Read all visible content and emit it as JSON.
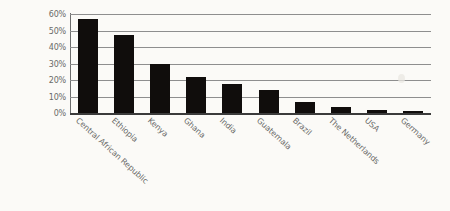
{
  "chart_data": {
    "type": "bar",
    "title": "",
    "xlabel": "",
    "ylabel": "",
    "categories": [
      "Central African Republic",
      "Ethiopia",
      "Kenya",
      "Ghana",
      "India",
      "Guatemala",
      "Brazil",
      "The Netherlands",
      "USA",
      "Germany"
    ],
    "values": [
      57,
      47.5,
      30,
      22,
      17.5,
      14,
      6.5,
      3.5,
      2,
      1.5
    ],
    "ylim": [
      0,
      60
    ],
    "ytick_labels": [
      "60%",
      "50%",
      "40%",
      "30%",
      "20%",
      "10%",
      "0%"
    ],
    "ytick_values": [
      60,
      50,
      40,
      30,
      20,
      10,
      0
    ],
    "grid": true,
    "legend": "none",
    "bar_color": "#100d0c",
    "grid_color": "#8e8e8e",
    "axis_color": "#6d6d6d",
    "label_color": "#6a6a68",
    "background_color": "#fbfaf7"
  }
}
